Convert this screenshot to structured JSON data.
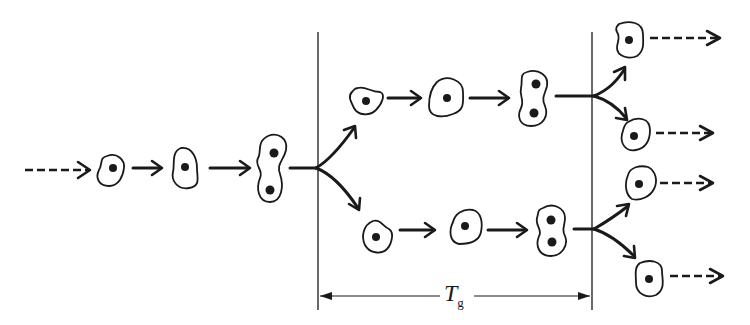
{
  "diagram": {
    "generation_time_label": {
      "main": "T",
      "sub": "g"
    },
    "stages": [
      {
        "id": "parent",
        "cells": [
          "cell",
          "growing cell",
          "dividing cell (2 nuclei)"
        ]
      },
      {
        "id": "daughter-top",
        "cells": [
          "cell",
          "growing cell",
          "dividing cell (2 nuclei)"
        ]
      },
      {
        "id": "daughter-bottom",
        "cells": [
          "cell",
          "growing cell",
          "dividing cell (2 nuclei)"
        ]
      },
      {
        "id": "granddaughters",
        "cells": [
          "cell",
          "cell",
          "cell",
          "cell"
        ]
      }
    ],
    "colors": {
      "ink": "#1a1a1a",
      "background": "#ffffff"
    }
  }
}
